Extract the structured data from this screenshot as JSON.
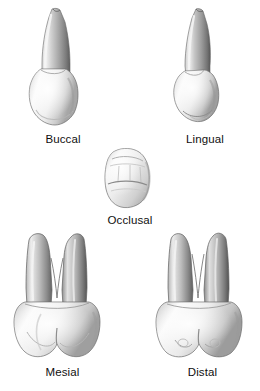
{
  "figure": {
    "background_color": "#ffffff",
    "label_color": "#101010",
    "views": [
      {
        "id": "buccal",
        "label": "Buccal",
        "form": "single-root-pointed-crown"
      },
      {
        "id": "lingual",
        "label": "Lingual",
        "form": "single-root-narrow-crown"
      },
      {
        "id": "occlusal",
        "label": "Occlusal",
        "form": "chewing-surface-with-grooves"
      },
      {
        "id": "mesial",
        "label": "Mesial",
        "form": "bifurcated-root-two-cusps"
      },
      {
        "id": "distal",
        "label": "Distal",
        "form": "bifurcated-root-two-cusps"
      }
    ],
    "palette": {
      "root_light": "#efefef",
      "root_mid": "#b3b3b3",
      "root_dark": "#6e6e6e",
      "root_edge": "#4a4a4a",
      "crown_light": "#fbfbfb",
      "crown_mid": "#dcdcdc",
      "crown_shadow": "#a8a8a8",
      "outline": "#5a5a5a"
    }
  }
}
